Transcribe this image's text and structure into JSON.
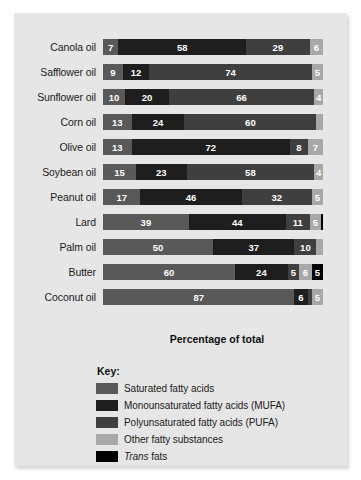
{
  "panel": {
    "background_color": "#e6e6e6"
  },
  "axis_title": "Percentage of total",
  "legend": {
    "title": "Key:",
    "items": [
      {
        "key": "sat",
        "label": "Saturated fatty acids",
        "color": "#595959"
      },
      {
        "key": "mufa",
        "label": "Monounsaturated fatty acids (MUFA)",
        "color": "#1e1e1e"
      },
      {
        "key": "pufa",
        "label": "Polyunsaturated fatty acids (PUFA)",
        "color": "#3f3f3f"
      },
      {
        "key": "other",
        "label": "Other fatty substances",
        "color": "#a8a8a8"
      },
      {
        "key": "trans",
        "label_italic": "Trans",
        "label_rest": " fats",
        "color": "#000000"
      }
    ]
  },
  "chart_data": {
    "type": "bar",
    "orientation": "horizontal",
    "stacked": true,
    "title": "",
    "xlabel": "Percentage of total",
    "ylabel": "",
    "xlim": [
      0,
      100
    ],
    "grid": false,
    "legend_position": "below",
    "categories": [
      "Canola oil",
      "Safflower oil",
      "Sunflower oil",
      "Corn oil",
      "Olive oil",
      "Soybean oil",
      "Peanut oil",
      "Lard",
      "Palm oil",
      "Butter",
      "Coconut oil"
    ],
    "series": [
      {
        "name": "Saturated fatty acids",
        "key": "sat",
        "color": "#595959",
        "values": [
          7,
          9,
          10,
          13,
          13,
          15,
          17,
          39,
          50,
          60,
          87
        ]
      },
      {
        "name": "Monounsaturated fatty acids (MUFA)",
        "key": "mufa",
        "color": "#1e1e1e",
        "values": [
          58,
          12,
          20,
          24,
          72,
          23,
          46,
          44,
          37,
          24,
          6
        ]
      },
      {
        "name": "Polyunsaturated fatty acids (PUFA)",
        "key": "pufa",
        "color": "#3f3f3f",
        "values": [
          29,
          74,
          66,
          60,
          8,
          58,
          32,
          11,
          10,
          5,
          2
        ]
      },
      {
        "name": "Other fatty substances",
        "key": "other",
        "color": "#a8a8a8",
        "values": [
          6,
          5,
          4,
          3,
          7,
          4,
          5,
          5,
          3,
          6,
          5
        ]
      },
      {
        "name": "Trans fats",
        "key": "trans",
        "color": "#000000",
        "values": [
          0,
          0,
          0,
          0,
          0,
          0,
          0,
          1,
          0,
          5,
          0
        ]
      }
    ],
    "rows": [
      {
        "label": "Canola oil",
        "segments": [
          {
            "key": "sat",
            "value": 7
          },
          {
            "key": "mufa",
            "value": 58
          },
          {
            "key": "pufa",
            "value": 29
          },
          {
            "key": "other",
            "value": 6
          }
        ]
      },
      {
        "label": "Safflower oil",
        "segments": [
          {
            "key": "sat",
            "value": 9
          },
          {
            "key": "mufa",
            "value": 12
          },
          {
            "key": "pufa",
            "value": 74
          },
          {
            "key": "other",
            "value": 5
          }
        ]
      },
      {
        "label": "Sunflower oil",
        "segments": [
          {
            "key": "sat",
            "value": 10
          },
          {
            "key": "mufa",
            "value": 20
          },
          {
            "key": "pufa",
            "value": 66
          },
          {
            "key": "other",
            "value": 4
          }
        ]
      },
      {
        "label": "Corn oil",
        "segments": [
          {
            "key": "sat",
            "value": 13
          },
          {
            "key": "mufa",
            "value": 24
          },
          {
            "key": "pufa",
            "value": 60
          },
          {
            "key": "other",
            "value": 3
          }
        ]
      },
      {
        "label": "Olive oil",
        "segments": [
          {
            "key": "sat",
            "value": 13
          },
          {
            "key": "mufa",
            "value": 72
          },
          {
            "key": "pufa",
            "value": 8
          },
          {
            "key": "other",
            "value": 7
          }
        ]
      },
      {
        "label": "Soybean oil",
        "segments": [
          {
            "key": "sat",
            "value": 15
          },
          {
            "key": "mufa",
            "value": 23
          },
          {
            "key": "pufa",
            "value": 58
          },
          {
            "key": "other",
            "value": 4
          }
        ]
      },
      {
        "label": "Peanut oil",
        "segments": [
          {
            "key": "sat",
            "value": 17
          },
          {
            "key": "mufa",
            "value": 46
          },
          {
            "key": "pufa",
            "value": 32
          },
          {
            "key": "other",
            "value": 5
          }
        ]
      },
      {
        "label": "Lard",
        "segments": [
          {
            "key": "sat",
            "value": 39
          },
          {
            "key": "mufa",
            "value": 44
          },
          {
            "key": "pufa",
            "value": 11
          },
          {
            "key": "other",
            "value": 5
          },
          {
            "key": "trans",
            "value": 1
          }
        ]
      },
      {
        "label": "Palm oil",
        "segments": [
          {
            "key": "sat",
            "value": 50
          },
          {
            "key": "mufa",
            "value": 37
          },
          {
            "key": "pufa",
            "value": 10
          },
          {
            "key": "other",
            "value": 3
          }
        ]
      },
      {
        "label": "Butter",
        "segments": [
          {
            "key": "sat",
            "value": 60
          },
          {
            "key": "mufa",
            "value": 24
          },
          {
            "key": "pufa",
            "value": 5
          },
          {
            "key": "other",
            "value": 6
          },
          {
            "key": "trans",
            "value": 5
          }
        ]
      },
      {
        "label": "Coconut oil",
        "segments": [
          {
            "key": "sat",
            "value": 87
          },
          {
            "key": "mufa",
            "value": 6
          },
          {
            "key": "pufa",
            "value": 2
          },
          {
            "key": "other",
            "value": 5
          }
        ]
      }
    ]
  }
}
